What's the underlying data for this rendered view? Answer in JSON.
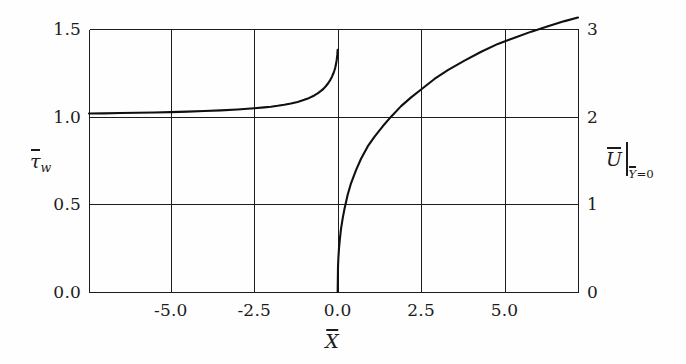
{
  "figure": {
    "background_color": "#fefefe",
    "line_color": "#101010",
    "axis_color": "#1c1c1c"
  },
  "axes": {
    "x_title": "X",
    "y_left_title_main": "τ",
    "y_left_title_sub": "w",
    "y_right_title_main": "U",
    "y_right_title_sub_var": "Y",
    "y_right_title_sub_eq": "=0"
  },
  "ticks": {
    "x": [
      "-5.0",
      "-2.5",
      "0.0",
      "2.5",
      "5.0"
    ],
    "y_left": [
      "0.0",
      "0.5",
      "1.0",
      "1.5"
    ],
    "y_right": [
      "0",
      "1",
      "2",
      "3"
    ]
  },
  "chart_data": {
    "type": "line",
    "title": "",
    "xlabel": "X̄",
    "ylabel": "τ̄_w",
    "y2label": "Ū|_{Ȳ=0}",
    "xlim": [
      -7.45,
      7.2
    ],
    "ylim": [
      0.0,
      1.5
    ],
    "y2lim": [
      0,
      3
    ],
    "grid": true,
    "legend": "none",
    "xticks": [
      -5.0,
      -2.5,
      0.0,
      2.5,
      5.0
    ],
    "yticks_left": [
      0.0,
      0.5,
      1.0,
      1.5
    ],
    "yticks_right": [
      0,
      1,
      2,
      3
    ],
    "series": [
      {
        "name": "tau_w_bar",
        "axis": "left",
        "comment": "wall shear stress, defined for X<0, rises from ~1.02 asymptotically to ~1.38 at X=0",
        "x": [
          -7.45,
          -7.0,
          -6.5,
          -6.0,
          -5.5,
          -5.0,
          -4.5,
          -4.0,
          -3.5,
          -3.0,
          -2.5,
          -2.2,
          -2.0,
          -1.8,
          -1.6,
          -1.4,
          -1.2,
          -1.0,
          -0.85,
          -0.7,
          -0.6,
          -0.5,
          -0.42,
          -0.35,
          -0.28,
          -0.22,
          -0.17,
          -0.13,
          -0.1,
          -0.07,
          -0.05,
          -0.03,
          -0.02,
          -0.01,
          0.0
        ],
        "y": [
          1.018,
          1.019,
          1.021,
          1.022,
          1.024,
          1.026,
          1.029,
          1.032,
          1.036,
          1.041,
          1.048,
          1.053,
          1.057,
          1.062,
          1.068,
          1.075,
          1.084,
          1.096,
          1.107,
          1.121,
          1.133,
          1.147,
          1.16,
          1.175,
          1.192,
          1.21,
          1.228,
          1.246,
          1.262,
          1.282,
          1.3,
          1.322,
          1.337,
          1.355,
          1.382
        ]
      },
      {
        "name": "U_bar_at_Ybar_0",
        "axis": "right",
        "comment": "slip velocity, defined for X>0, grows like X^(1/3) from 0, passes (2.5, 2), reaches 3 at right edge",
        "x": [
          0.0,
          0.01,
          0.02,
          0.04,
          0.07,
          0.1,
          0.15,
          0.2,
          0.3,
          0.4,
          0.55,
          0.7,
          0.9,
          1.1,
          1.35,
          1.6,
          1.9,
          2.2,
          2.5,
          2.9,
          3.3,
          3.8,
          4.3,
          4.8,
          5.3,
          5.8,
          6.3,
          6.8,
          7.2
        ],
        "y": [
          0.0,
          0.29,
          0.38,
          0.5,
          0.62,
          0.72,
          0.84,
          0.94,
          1.11,
          1.24,
          1.39,
          1.52,
          1.66,
          1.77,
          1.89,
          2.0,
          2.12,
          2.22,
          2.31,
          2.43,
          2.53,
          2.64,
          2.74,
          2.83,
          2.9,
          2.97,
          3.03,
          3.09,
          3.13
        ]
      }
    ]
  },
  "geometry": {
    "plot_left": 89,
    "plot_right": 578,
    "plot_top": 29,
    "plot_bottom": 292
  }
}
